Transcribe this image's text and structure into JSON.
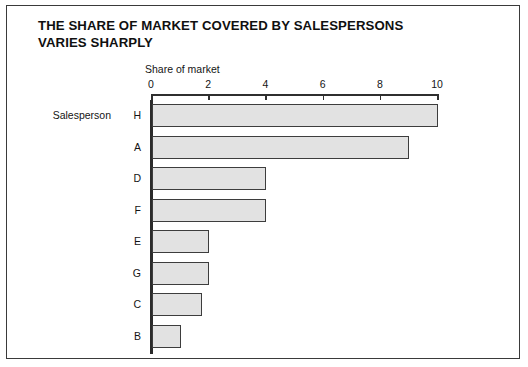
{
  "figure": {
    "title_lines": [
      "THE SHARE OF MARKET COVERED BY SALESPERSONS",
      "VARIES SHARPLY"
    ],
    "series_label": "Salesperson",
    "bar_fill_color": "#e2e2e2",
    "bar_border_color": "#3d3d3d",
    "frame_color": "#3a3a3a",
    "background_color": "#ffffff"
  },
  "chart_data": {
    "type": "bar",
    "orientation": "horizontal",
    "xlabel": "Share of market",
    "ylabel": "Salesperson",
    "categories": [
      "H",
      "A",
      "D",
      "F",
      "E",
      "G",
      "C",
      "B"
    ],
    "values": [
      10.0,
      9.0,
      4.0,
      4.0,
      2.0,
      2.0,
      1.75,
      1.0
    ],
    "xlim": [
      0,
      10
    ],
    "xticks": [
      0,
      2,
      4,
      6,
      8,
      10
    ],
    "xtick_labels": [
      "0",
      "2",
      "4",
      "6",
      "8",
      "10"
    ],
    "grid": false,
    "legend": false
  }
}
